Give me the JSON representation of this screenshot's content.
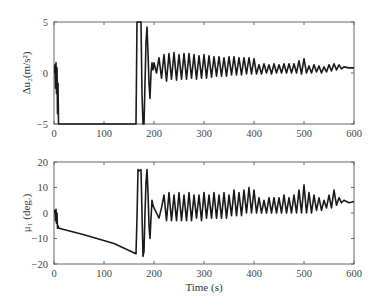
{
  "chart_data": [
    {
      "type": "line",
      "title": "",
      "xlabel": "",
      "ylabel": "Δu₂(m/s²)",
      "xlim": [
        0,
        600
      ],
      "ylim": [
        -5,
        5
      ],
      "xticks": [
        "0",
        "100",
        "200",
        "300",
        "400",
        "500",
        "600"
      ],
      "yticks": [
        "5",
        "0",
        "-5"
      ],
      "grid": false,
      "series": [
        {
          "name": "delta_u2",
          "x": [
            0,
            2,
            3,
            4,
            5,
            6,
            7,
            8,
            9,
            10,
            12,
            60,
            120,
            164,
            166,
            168,
            170,
            172,
            174,
            176,
            178,
            180,
            182,
            184,
            186,
            188,
            190,
            192,
            194,
            196,
            198,
            200,
            205,
            210,
            215,
            220,
            225,
            230,
            235,
            240,
            245,
            250,
            255,
            260,
            265,
            270,
            275,
            280,
            285,
            290,
            295,
            300,
            305,
            310,
            315,
            320,
            325,
            330,
            335,
            340,
            345,
            350,
            355,
            360,
            365,
            370,
            375,
            380,
            385,
            390,
            395,
            400,
            405,
            410,
            415,
            420,
            425,
            430,
            435,
            440,
            445,
            450,
            455,
            460,
            465,
            470,
            475,
            480,
            485,
            490,
            495,
            500,
            505,
            510,
            515,
            520,
            525,
            530,
            535,
            540,
            545,
            550,
            555,
            560,
            565,
            570,
            575,
            580,
            590,
            600
          ],
          "y": [
            0,
            0.8,
            -1.5,
            1,
            -2,
            0.5,
            -4,
            -1,
            -5,
            -5,
            -5,
            -5,
            -5,
            -5,
            5,
            5,
            5,
            5,
            5,
            -2,
            -5,
            -5,
            -1,
            3,
            4.5,
            2,
            -1,
            -2.5,
            0,
            1,
            0.3,
            1,
            0,
            1.5,
            -0.5,
            1.8,
            -0.8,
            1.9,
            -0.6,
            2,
            -0.7,
            1.8,
            -0.6,
            1.9,
            -0.6,
            1.9,
            -0.5,
            1.8,
            -0.6,
            1.7,
            -0.5,
            1.8,
            -0.5,
            1.7,
            -0.4,
            1.6,
            -0.3,
            1.6,
            -0.3,
            1.5,
            -0.3,
            1.6,
            -0.2,
            1.6,
            -0.2,
            1.5,
            -0.2,
            1.5,
            -0.1,
            1.5,
            -0.1,
            1.4,
            -0.1,
            0.8,
            -0.1,
            0.9,
            0,
            0.8,
            -0.1,
            0.9,
            0,
            0.8,
            0,
            0.9,
            0,
            0.9,
            0,
            0.9,
            0,
            1.2,
            -0.1,
            1.4,
            0,
            0.7,
            0,
            0.8,
            0.1,
            0.7,
            0,
            0.6,
            0.1,
            0.8,
            0.2,
            0.9,
            0.3,
            0.8,
            0.4,
            0.6,
            0.5,
            0.5
          ]
        }
      ]
    },
    {
      "type": "line",
      "title": "",
      "xlabel": "Time (s)",
      "ylabel": "μ₁ (deg.)",
      "xlim": [
        0,
        600
      ],
      "ylim": [
        -20,
        20
      ],
      "xticks": [
        "0",
        "100",
        "200",
        "300",
        "400",
        "500",
        "600"
      ],
      "yticks": [
        "20",
        "10",
        "0",
        "-10",
        "-20"
      ],
      "grid": false,
      "series": [
        {
          "name": "mu_1",
          "x": [
            0,
            2,
            3,
            4,
            5,
            6,
            7,
            8,
            10,
            60,
            120,
            164,
            166,
            168,
            170,
            174,
            176,
            178,
            180,
            182,
            184,
            186,
            188,
            190,
            192,
            194,
            196,
            198,
            200,
            205,
            210,
            215,
            220,
            225,
            230,
            235,
            240,
            245,
            250,
            255,
            260,
            265,
            270,
            275,
            280,
            285,
            290,
            295,
            300,
            305,
            310,
            315,
            320,
            325,
            330,
            335,
            340,
            345,
            350,
            355,
            360,
            365,
            370,
            375,
            380,
            385,
            390,
            395,
            400,
            405,
            410,
            415,
            420,
            425,
            430,
            435,
            440,
            445,
            450,
            455,
            460,
            465,
            470,
            475,
            480,
            485,
            490,
            495,
            500,
            505,
            510,
            515,
            520,
            525,
            530,
            535,
            540,
            545,
            550,
            555,
            560,
            565,
            570,
            575,
            580,
            590,
            600
          ],
          "y": [
            0,
            1,
            -3,
            1.5,
            -4,
            0,
            -6,
            -5,
            -6,
            -8.5,
            -12,
            -16,
            -2,
            17,
            16.5,
            17,
            0,
            -17,
            -15,
            0,
            12,
            17,
            8,
            -5,
            -10,
            -2,
            5,
            3,
            2,
            0,
            -2,
            2,
            7,
            -3,
            8,
            -3,
            7,
            -3,
            8,
            -3,
            7,
            -3,
            8,
            -3,
            7,
            -2,
            7,
            -3,
            8,
            -2,
            7,
            -2,
            8,
            -2,
            7,
            -2,
            8,
            -2,
            7,
            -1,
            9,
            -1,
            8,
            -1,
            9,
            0,
            10,
            0,
            9,
            0,
            6,
            0,
            5,
            0,
            6,
            0,
            6,
            0,
            6,
            0,
            7,
            0,
            6,
            0,
            7,
            0,
            9,
            0,
            11,
            0,
            8,
            0,
            7,
            1,
            6,
            1,
            5,
            2,
            7,
            2,
            9,
            3,
            6,
            4,
            5,
            4,
            4.5,
            4,
            3.5
          ]
        }
      ]
    }
  ],
  "plots": {
    "top": {
      "ylabel": "Δu₂(m/s²)",
      "yticks": [
        "5",
        "0",
        "−5"
      ],
      "xticks": [
        "0",
        "100",
        "200",
        "300",
        "400",
        "500",
        "600"
      ]
    },
    "bottom": {
      "ylabel": "μ₁ (deg.)",
      "yticks": [
        "20",
        "10",
        "0",
        "−10",
        "−20"
      ],
      "xticks": [
        "0",
        "100",
        "200",
        "300",
        "400",
        "500",
        "600"
      ],
      "xlabel": "Time (s)"
    }
  }
}
